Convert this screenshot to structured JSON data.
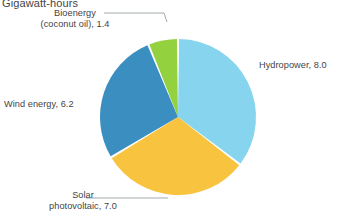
{
  "chart": {
    "title": "Gigawatt-hours"
  },
  "labels": {
    "bioenergy_line1": "Bioenergy",
    "bioenergy_line2": "(coconut oil), 1.4",
    "hydropower": "Hydropower, 8.0",
    "wind": "Wind energy, 6.2",
    "solar_line1": "Solar",
    "solar_line2": "photovoltaic, 7.0"
  },
  "chart_data": {
    "type": "pie",
    "title": "Gigawatt-hours",
    "unit": "Gigawatt-hours",
    "xlabel": "",
    "ylabel": "",
    "legend_position": "none",
    "grid": false,
    "total": 22.6,
    "categories": [
      "Hydropower",
      "Solar photovoltaic",
      "Wind energy",
      "Bioenergy (coconut oil)"
    ],
    "values": [
      8.0,
      7.0,
      6.2,
      1.4
    ],
    "labels": [
      "Hydropower, 8.0",
      "Solar photovoltaic, 7.0",
      "Wind energy, 6.2",
      "Bioenergy (coconut oil), 1.4"
    ],
    "colors": [
      "#87d4ef",
      "#f8c43f",
      "#3a8ec0",
      "#94d13f"
    ],
    "slices": [
      {
        "name": "Hydropower",
        "value": 8.0,
        "color": "#87d4ef",
        "percent": 35.4
      },
      {
        "name": "Solar photovoltaic",
        "value": 7.0,
        "color": "#f8c43f",
        "percent": 31.0
      },
      {
        "name": "Wind energy",
        "value": 6.2,
        "color": "#3a8ec0",
        "percent": 27.4
      },
      {
        "name": "Bioenergy (coconut oil)",
        "value": 1.4,
        "color": "#94d13f",
        "percent": 6.2
      }
    ],
    "start_angle_deg": 0,
    "direction": "clockwise"
  },
  "geometry": {
    "center_x": 178,
    "center_y": 117,
    "radius": 78,
    "gap_deg": 1.6
  },
  "leader_lines": {
    "bioenergy_color": "#9aa0a4",
    "solar_color": "#9aa0a4"
  }
}
